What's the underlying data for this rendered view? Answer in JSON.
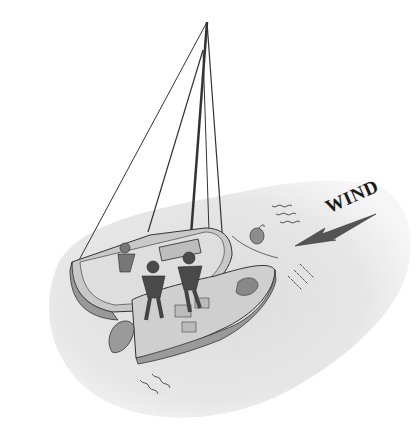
{
  "illustration": {
    "subject": "sailboat with crew heeling, viewed from above, on water",
    "wind_label": "WIND",
    "colors": {
      "water": "#e4e4e4",
      "water_edge": "#f2f2f2",
      "hull_dark": "#8a8a8a",
      "hull_mid": "#b4b4b4",
      "deck_light": "#d6d6d6",
      "crew": "#4a4a4a",
      "arrow": "#555555",
      "line": "#333333"
    }
  }
}
